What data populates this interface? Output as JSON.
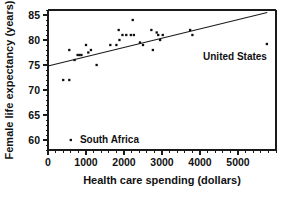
{
  "chart_data": {
    "type": "scatter",
    "title": "",
    "xlabel": "Health care spending (dollars)",
    "ylabel": "Female life expectancy (years)",
    "xlim": [
      0,
      6000
    ],
    "ylim": [
      58,
      86
    ],
    "grid": false,
    "legend": "none",
    "xticks": [
      0,
      1000,
      2000,
      3000,
      4000,
      5000
    ],
    "xtick_labels": [
      "0",
      "1000",
      "2000",
      "3000",
      "4000",
      "5000"
    ],
    "yticks": [
      60,
      65,
      70,
      75,
      80,
      85
    ],
    "ytick_labels": [
      "60",
      "65",
      "70",
      "75",
      "80",
      "85"
    ],
    "x_minor_interval": 200,
    "y_minor_interval": 1,
    "marker": "square",
    "marker_size": 2.3,
    "marker_color": "#0d0d0d",
    "points": [
      {
        "x": 400,
        "y": 72.0
      },
      {
        "x": 560,
        "y": 72.0
      },
      {
        "x": 560,
        "y": 78.0
      },
      {
        "x": 600,
        "y": 60.0
      },
      {
        "x": 700,
        "y": 76.0
      },
      {
        "x": 780,
        "y": 77.0
      },
      {
        "x": 830,
        "y": 77.0
      },
      {
        "x": 880,
        "y": 77.0
      },
      {
        "x": 1000,
        "y": 79.0
      },
      {
        "x": 1060,
        "y": 77.5
      },
      {
        "x": 1130,
        "y": 78.0
      },
      {
        "x": 1280,
        "y": 75.0
      },
      {
        "x": 1640,
        "y": 79.0
      },
      {
        "x": 1800,
        "y": 79.0
      },
      {
        "x": 1860,
        "y": 82.0
      },
      {
        "x": 1880,
        "y": 80.0
      },
      {
        "x": 1960,
        "y": 81.0
      },
      {
        "x": 2060,
        "y": 81.0
      },
      {
        "x": 2180,
        "y": 81.0
      },
      {
        "x": 2230,
        "y": 84.0
      },
      {
        "x": 2260,
        "y": 81.0
      },
      {
        "x": 2420,
        "y": 79.5
      },
      {
        "x": 2500,
        "y": 79.0
      },
      {
        "x": 2720,
        "y": 82.0
      },
      {
        "x": 2760,
        "y": 78.0
      },
      {
        "x": 2860,
        "y": 81.5
      },
      {
        "x": 2900,
        "y": 81.0
      },
      {
        "x": 2950,
        "y": 80.0
      },
      {
        "x": 3020,
        "y": 81.0
      },
      {
        "x": 3740,
        "y": 82.0
      },
      {
        "x": 3800,
        "y": 81.0
      },
      {
        "x": 5760,
        "y": 79.2
      }
    ],
    "trend_line": {
      "x_start": 0,
      "y_start": 74.8,
      "x_end": 5770,
      "y_end": 85.5
    },
    "annotations": [
      {
        "label": "United States",
        "label_x": 4080,
        "label_y": 76.6,
        "point_x": 5760,
        "point_y": 79.2
      },
      {
        "label": "South Africa",
        "label_x": 840,
        "label_y": 60.0,
        "point_x": 600,
        "point_y": 60.0
      }
    ]
  }
}
